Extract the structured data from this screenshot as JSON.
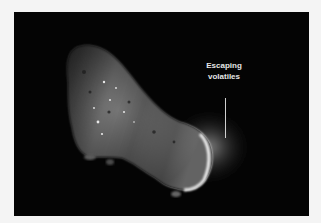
{
  "figure": {
    "annotation": {
      "line1": "Escaping",
      "line2": "volatiles"
    },
    "colors": {
      "page_background": "#f4f4f4",
      "image_background": "#040404",
      "label_text": "#e6e6e6"
    }
  }
}
